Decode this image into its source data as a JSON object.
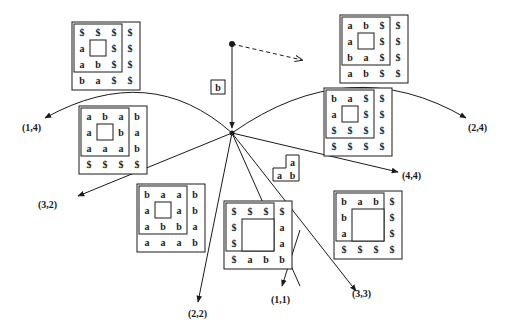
{
  "diagram": {
    "type": "tiling-transition-graph",
    "center": {
      "x": 232,
      "y": 133
    },
    "start_point": {
      "x": 232,
      "y": 44
    },
    "dashed_arrow": {
      "from": [
        232,
        44
      ],
      "to": [
        302,
        60
      ]
    },
    "start_tile": {
      "label": "b",
      "x": 211,
      "y": 80,
      "w": 14,
      "h": 14
    },
    "edges": [
      {
        "label": "(1,4)",
        "kind": "arc",
        "path": "M232,133 Q150,60 45,118",
        "label_pos": [
          22,
          130
        ]
      },
      {
        "label": "(2,4)",
        "kind": "arc",
        "path": "M232,133 Q350,50 466,118",
        "label_pos": [
          468,
          131
        ]
      },
      {
        "label": "(3,2)",
        "kind": "line",
        "end": [
          78,
          195
        ],
        "label_pos": [
          38,
          208
        ]
      },
      {
        "label": "(4,4)",
        "kind": "line",
        "end": [
          398,
          172
        ],
        "label_pos": [
          402,
          178
        ]
      },
      {
        "label": "(2,2)",
        "kind": "line",
        "end": [
          198,
          300
        ],
        "label_pos": [
          188,
          317
        ]
      },
      {
        "label": "(1,1)",
        "kind": "line",
        "end": [
          282,
          285
        ],
        "label_pos": [
          271,
          303
        ]
      },
      {
        "label": "(3,3)",
        "kind": "line",
        "end": [
          355,
          290
        ],
        "label_pos": [
          352,
          297
        ]
      }
    ],
    "small_shape": {
      "cells": [
        {
          "r": 0,
          "c": 1,
          "v": "a"
        },
        {
          "r": 1,
          "c": 0,
          "v": "a"
        },
        {
          "r": 1,
          "c": 1,
          "v": "b"
        }
      ],
      "x": 273,
      "y": 155,
      "cell": 13
    },
    "grids": [
      {
        "name": "grid-top-left",
        "x": 74,
        "y": 24,
        "cell": 16,
        "rows": [
          [
            "$",
            "$",
            "$",
            "$"
          ],
          [
            "a",
            "",
            "$",
            "$"
          ],
          [
            "a",
            "b",
            "$",
            "$"
          ],
          [
            "b",
            "a",
            "$",
            "$"
          ]
        ],
        "inner": [
          1,
          1
        ]
      },
      {
        "name": "grid-top-right",
        "x": 342,
        "y": 17,
        "cell": 16,
        "rows": [
          [
            "a",
            "b",
            "$",
            "$"
          ],
          [
            "a",
            "",
            "$",
            "$"
          ],
          [
            "b",
            "a",
            "$",
            "$"
          ],
          [
            "a",
            "b",
            "$",
            "$"
          ]
        ],
        "inner": [
          1,
          1
        ]
      },
      {
        "name": "grid-right-upper",
        "x": 326,
        "y": 90,
        "cell": 16,
        "rows": [
          [
            "b",
            "a",
            "$",
            "$"
          ],
          [
            "a",
            "",
            "$",
            "$"
          ],
          [
            "$",
            "$",
            "$",
            "$"
          ],
          [
            "$",
            "$",
            "$",
            "$"
          ]
        ],
        "inner": [
          1,
          1
        ]
      },
      {
        "name": "grid-left-middle",
        "x": 81,
        "y": 108,
        "cell": 16,
        "rows": [
          [
            "a",
            "b",
            "a",
            "b"
          ],
          [
            "a",
            "",
            "b",
            "a"
          ],
          [
            "a",
            "a",
            "a",
            "b"
          ],
          [
            "$",
            "$",
            "$",
            "$"
          ]
        ],
        "inner": [
          1,
          1
        ]
      },
      {
        "name": "grid-lower-left",
        "x": 139,
        "y": 186,
        "cell": 16,
        "rows": [
          [
            "b",
            "a",
            "a",
            "b"
          ],
          [
            "a",
            "",
            "a",
            "b"
          ],
          [
            "a",
            "b",
            "b",
            "a"
          ],
          [
            "a",
            "a",
            "a",
            "b"
          ]
        ],
        "inner": [
          1,
          1
        ]
      },
      {
        "name": "grid-lower-center",
        "x": 226,
        "y": 203,
        "cell": 16,
        "rows": [
          [
            "$",
            "$",
            "$",
            "$"
          ],
          [
            "$",
            "",
            "",
            "a"
          ],
          [
            "$",
            "",
            "",
            "a"
          ],
          [
            "$",
            "a",
            "b",
            "b"
          ]
        ],
        "inner": [
          1,
          1
        ],
        "inner_size": 2
      },
      {
        "name": "grid-lower-right",
        "x": 336,
        "y": 193,
        "cell": 16,
        "rows": [
          [
            "b",
            "a",
            "b",
            "$"
          ],
          [
            "b",
            "",
            "",
            "$"
          ],
          [
            "a",
            "",
            "",
            "$"
          ],
          [
            "$",
            "$",
            "$",
            "$"
          ]
        ],
        "inner": [
          1,
          1
        ],
        "inner_size": 2
      }
    ]
  },
  "labels": {
    "start_tile": "b",
    "edge_1_4": "(1,4)",
    "edge_2_4": "(2,4)",
    "edge_3_2": "(3,2)",
    "edge_4_4": "(4,4)",
    "edge_2_2": "(2,2)",
    "edge_1_1": "(1,1)",
    "edge_3_3": "(3,3)"
  }
}
